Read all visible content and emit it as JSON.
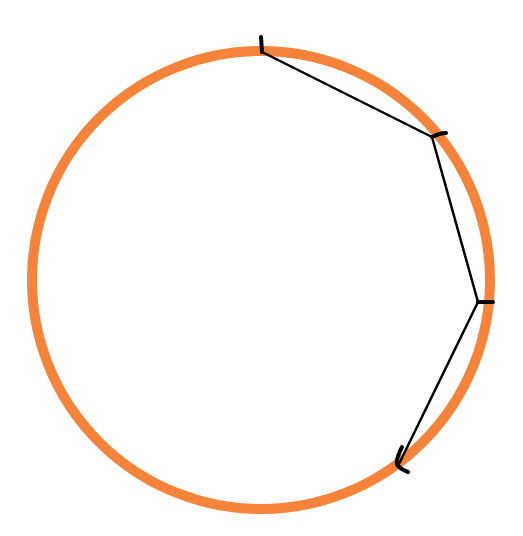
{
  "diagram": {
    "circle": {
      "cx": 261,
      "cy": 280,
      "r": 229,
      "stroke": "#f5843a",
      "stroke_width": 10
    },
    "chords": {
      "color": "#000000",
      "width": 2.5,
      "points": [
        {
          "x": 262,
          "y": 52
        },
        {
          "x": 432,
          "y": 137
        },
        {
          "x": 478,
          "y": 302
        },
        {
          "x": 398,
          "y": 466
        }
      ]
    },
    "ticks": [
      {
        "d": "M261,37 L262,52"
      },
      {
        "d": "M432,137 Q440,133 446,133"
      },
      {
        "d": "M478,302 L493,302"
      },
      {
        "d": "M402,447 Q394,463 398,466 Q402,470 408,472"
      }
    ]
  }
}
